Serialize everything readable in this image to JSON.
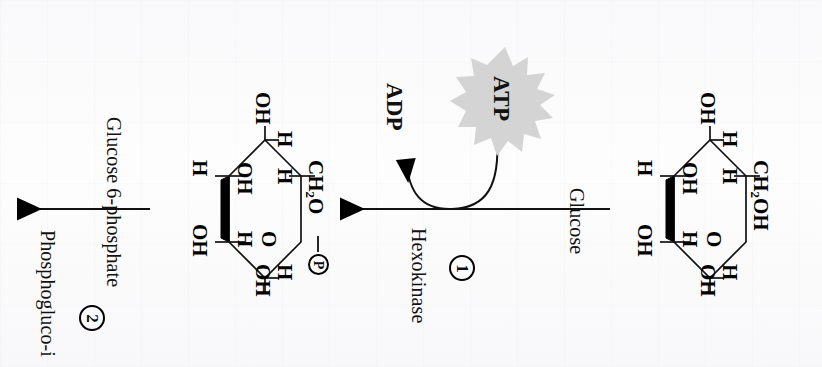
{
  "figure": {
    "orientation": "text rotated 90 degrees clockwise (reads bottom-to-top)",
    "background_color": "#fbfbfc",
    "ink_color": "#0b0b0b",
    "starburst_color": "#d4d4d4"
  },
  "labels": {
    "glucose": "Glucose",
    "glucose_6_phosphate": "Glucose 6-phosphate",
    "hexokinase": "Hexokinase",
    "phosphogluco_isomerase": "Phosphogluco-i",
    "atp": "ATP",
    "adp": "ADP",
    "step_one": "1",
    "step_two": "2"
  },
  "molecules": {
    "glucose": {
      "name": "Glucose",
      "ring_atoms": [
        "O"
      ],
      "substituents": {
        "c1_h": "H",
        "c1_oh": "OH",
        "c2_oh_upper": "OH",
        "c2_h": "H",
        "c3_h": "H",
        "c3_oh": "OH",
        "c4_oh_left": "OH",
        "c4_h_left": "H",
        "c5_oh_lower": "OH",
        "c5_h_lower": "H",
        "c6": "CH2OH"
      },
      "c6_group_text": "CH",
      "c6_group_sub": "2",
      "c6_group_tail": "OH"
    },
    "glucose_6_phosphate": {
      "name": "Glucose 6-phosphate",
      "ring_atoms": [
        "O"
      ],
      "substituents": {
        "c1_h": "H",
        "c1_oh": "OH",
        "c2_oh_upper": "OH",
        "c2_h": "H",
        "c3_h": "H",
        "c3_oh": "OH",
        "c4_oh_left": "OH",
        "c4_h_left": "H",
        "c5_oh_lower": "OH",
        "c5_h_lower": "H",
        "c6": "CH2O—P"
      },
      "c6_group_text": "CH",
      "c6_group_sub": "2",
      "c6_group_tail": "O",
      "phosphate_symbol": "P"
    }
  },
  "reactions": [
    {
      "id": "reaction-1",
      "step_number": "1",
      "enzyme": "Hexokinase",
      "substrate": "Glucose",
      "product": "Glucose 6-phosphate",
      "cofactor_in": "ATP",
      "cofactor_out": "ADP",
      "arrow_direction": "right-to-left"
    },
    {
      "id": "reaction-2",
      "step_number": "2",
      "enzyme": "Phosphogluco-i",
      "substrate": "Glucose 6-phosphate",
      "product": "",
      "cofactor_in": "",
      "cofactor_out": "",
      "arrow_direction": "right-to-left"
    }
  ]
}
